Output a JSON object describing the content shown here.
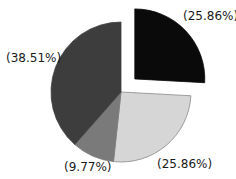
{
  "chart_data": {
    "type": "pie",
    "title": "",
    "start_angle_deg": 0,
    "direction": "clockwise",
    "slices": [
      {
        "label": "(25.86%)",
        "value": 25.86,
        "color": "#0a0a0a",
        "exploded": true
      },
      {
        "label": "(25.86%)",
        "value": 25.86,
        "color": "#d6d6d6",
        "exploded": false
      },
      {
        "label": "(9.77%)",
        "value": 9.77,
        "color": "#7a7a7a",
        "exploded": false
      },
      {
        "label": "(38.51%)",
        "value": 38.51,
        "color": "#3d3d3d",
        "exploded": false
      }
    ],
    "legend": null
  },
  "labels": {
    "slice1": "(25.86%)",
    "slice2": "(25.86%)",
    "slice3": "(9.77%)",
    "slice4": "(38.51%)"
  }
}
